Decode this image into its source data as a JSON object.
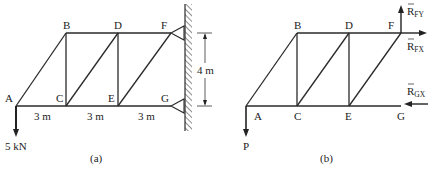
{
  "figure_a": {
    "caption": "(a)",
    "nodes": {
      "A": "A",
      "B": "B",
      "C": "C",
      "D": "D",
      "E": "E",
      "F": "F",
      "G": "G"
    },
    "spans": [
      "3 m",
      "3 m",
      "3 m"
    ],
    "height_dim": "4 m",
    "load": "5 kN"
  },
  "figure_b": {
    "caption": "(b)",
    "nodes": {
      "A": "A",
      "B": "B",
      "C": "C",
      "D": "D",
      "E": "E",
      "F": "F",
      "G": "G"
    },
    "load": "P",
    "reactions": {
      "rfy": {
        "main": "R",
        "sub": "FY"
      },
      "rfx": {
        "main": "R",
        "sub": "FX"
      },
      "rgx": {
        "main": "R",
        "sub": "GX"
      }
    }
  }
}
